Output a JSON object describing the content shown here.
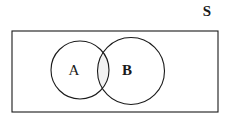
{
  "figure": {
    "type": "venn-diagram",
    "caption_visible": false,
    "background_color": "#ffffff",
    "stroke_color": "#1a1a1a",
    "intersection_fill": "#f4f4f4"
  },
  "universe": {
    "label": "S",
    "shape": "rectangle",
    "x": 12,
    "y": 31,
    "width": 206,
    "height": 81,
    "label_x": 207,
    "label_y": 16
  },
  "sets": [
    {
      "label": "A",
      "shape": "circle",
      "cx": 80,
      "cy": 70,
      "r": 29,
      "label_x": 74,
      "label_y": 75
    },
    {
      "label": "B",
      "shape": "circle",
      "cx": 131,
      "cy": 71,
      "r": 33.5,
      "label_x": 127,
      "label_y": 75
    }
  ],
  "intersection": {
    "label": "",
    "shaded": true,
    "shade_color": "#f2f2f2"
  }
}
